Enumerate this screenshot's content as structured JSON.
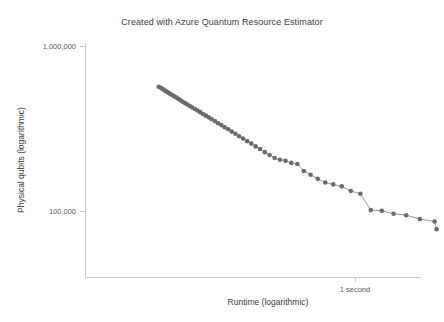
{
  "chart": {
    "title": "Created with Azure Quantum Resource Estimator",
    "xlabel": "Runtime (logarithmic)",
    "ylabel": "Physical qubits (logarithmic)",
    "y_tick_top_label": "1,000,000",
    "y_tick_bottom_label": "100,000",
    "x_tick_label": "1 second",
    "marker_color": "#6b6b6b",
    "line_color": "#8a8a8a",
    "axis_color": "#c8c8c8",
    "title_color": "#3b3b3b"
  },
  "chart_data": {
    "type": "scatter",
    "title": "Created with Azure Quantum Resource Estimator",
    "xlabel": "Runtime (logarithmic)",
    "ylabel": "Physical qubits (logarithmic)",
    "xscale": "log",
    "yscale": "log",
    "grid": false,
    "legend": null,
    "xticks": [
      1
    ],
    "xticklabels": [
      "1 second"
    ],
    "yticks": [
      1000000,
      100000
    ],
    "yticklabels": [
      "1,000,000",
      "100,000"
    ],
    "ylim": [
      30000,
      1300000
    ],
    "xlim": [
      0.012,
      6.0
    ],
    "series": [
      {
        "name": "Pareto frontier",
        "x": [
          0.029,
          0.03,
          0.0309,
          0.0318,
          0.0328,
          0.0338,
          0.0349,
          0.036,
          0.0372,
          0.0385,
          0.0399,
          0.0414,
          0.043,
          0.0447,
          0.0466,
          0.0486,
          0.0508,
          0.0531,
          0.0556,
          0.0583,
          0.0612,
          0.0643,
          0.0677,
          0.0714,
          0.0754,
          0.0797,
          0.0844,
          0.0895,
          0.0951,
          0.1012,
          0.1079,
          0.1153,
          0.1234,
          0.1324,
          0.1424,
          0.1535,
          0.1659,
          0.1798,
          0.1955,
          0.2133,
          0.2336,
          0.2569,
          0.2838,
          0.315,
          0.3515,
          0.3945,
          0.4456,
          0.5066,
          0.5802,
          0.67,
          0.7806,
          0.9185,
          1.0925,
          1.315,
          1.604,
          1.984,
          2.49,
          3.18,
          4.15,
          4.3
        ],
        "y": [
          570000,
          562000,
          554000,
          546000,
          538000,
          530000,
          522000,
          514000,
          506000,
          498000,
          490000,
          481000,
          472000,
          463000,
          454000,
          445000,
          436000,
          427000,
          418000,
          409000,
          400000,
          390000,
          381000,
          372000,
          362000,
          353000,
          343000,
          334000,
          324000,
          315000,
          305000,
          296000,
          286000,
          277000,
          267000,
          258000,
          248000,
          239000,
          229000,
          220000,
          211000,
          206000,
          203000,
          197000,
          194000,
          176000,
          167000,
          158000,
          150000,
          146000,
          142000,
          133000,
          128000,
          102000,
          101000,
          97000,
          95000,
          90000,
          87000,
          78000
        ],
        "n_points": 60
      }
    ],
    "annotations": [],
    "note": "Monotonically decreasing Pareto frontier of physical qubits vs runtime; points densely overlap at short runtimes (upper left) and become sparse at long runtimes (lower right)."
  }
}
